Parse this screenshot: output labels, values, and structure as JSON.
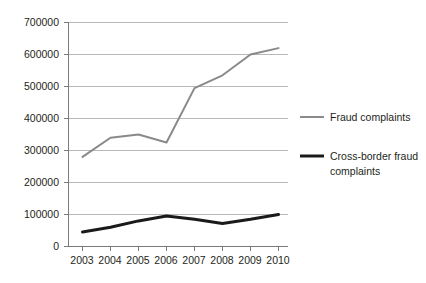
{
  "chart_data": {
    "type": "line",
    "title": "",
    "xlabel": "",
    "ylabel": "",
    "categories": [
      "2003",
      "2004",
      "2005",
      "2006",
      "2007",
      "2008",
      "2009",
      "2010"
    ],
    "series": [
      {
        "name": "Fraud complaints",
        "color": "#8a8a8a",
        "values": [
          280000,
          340000,
          350000,
          325000,
          495000,
          535000,
          600000,
          620000
        ]
      },
      {
        "name": "Cross-border fraud complaints",
        "color": "#1a1a1a",
        "values": [
          45000,
          60000,
          80000,
          95000,
          85000,
          72000,
          85000,
          100000
        ]
      }
    ],
    "ylim": [
      0,
      700000
    ],
    "ytick_labels": [
      "0",
      "100000",
      "200000",
      "300000",
      "400000",
      "500000",
      "600000",
      "700000"
    ],
    "ytick_values": [
      0,
      100000,
      200000,
      300000,
      400000,
      500000,
      600000,
      700000
    ],
    "grid": true,
    "legend_position": "right"
  },
  "legend": {
    "entries": [
      {
        "label": "Fraud complaints",
        "line1": "Fraud complaints",
        "line2": ""
      },
      {
        "label": "Cross-border fraud complaints",
        "line1": "Cross-border fraud",
        "line2": "complaints"
      }
    ]
  },
  "axis": {
    "y_labels": [
      "700000",
      "600000",
      "500000",
      "400000",
      "300000",
      "200000",
      "100000",
      "0"
    ],
    "x_labels": [
      "2003",
      "2004",
      "2005",
      "2006",
      "2007",
      "2008",
      "2009",
      "2010"
    ]
  }
}
